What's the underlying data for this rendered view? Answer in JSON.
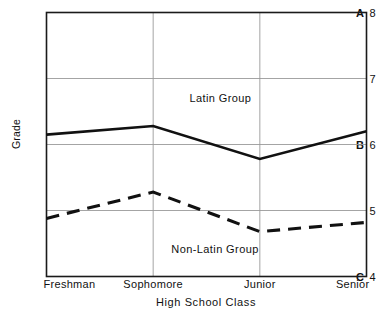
{
  "chart_data": {
    "type": "line",
    "title": "",
    "xlabel": "High School Class",
    "ylabel": "Grade",
    "categories": [
      "Freshman",
      "Sophomore",
      "Junior",
      "Senior"
    ],
    "ylim": [
      4,
      8
    ],
    "xlim": [
      0,
      3
    ],
    "grid": true,
    "legend_position": "inline-annotations",
    "y_ticks": [
      {
        "value": 8,
        "letter": "A",
        "number": "8"
      },
      {
        "value": 7,
        "letter": "",
        "number": "7"
      },
      {
        "value": 6,
        "letter": "B",
        "number": "6"
      },
      {
        "value": 5,
        "letter": "",
        "number": "5"
      },
      {
        "value": 4,
        "letter": "C",
        "number": "4"
      }
    ],
    "series": [
      {
        "name": "Latin Group",
        "style": "solid",
        "color": "#111111",
        "values": [
          6.15,
          6.28,
          5.78,
          6.2
        ],
        "label_x": 1.63,
        "label_y": 6.7
      },
      {
        "name": "Non-Latin Group",
        "style": "dashed",
        "color": "#111111",
        "values": [
          4.88,
          5.28,
          4.68,
          4.82
        ],
        "label_x": 1.58,
        "label_y": 4.42
      }
    ]
  },
  "axis": {
    "y_label_text": "Grade",
    "x_label_text": "High School Class"
  }
}
